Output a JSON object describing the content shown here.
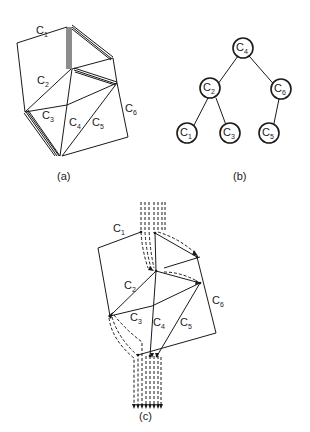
{
  "figure": {
    "panels": [
      {
        "id": "a",
        "caption": "(a)",
        "description": "Triangulated polygon partitioned into chains",
        "chain_labels": [
          {
            "name": "C",
            "sub": "1"
          },
          {
            "name": "C",
            "sub": "2"
          },
          {
            "name": "C",
            "sub": "3"
          },
          {
            "name": "C",
            "sub": "4"
          },
          {
            "name": "C",
            "sub": "5"
          },
          {
            "name": "C",
            "sub": "6"
          }
        ]
      },
      {
        "id": "b",
        "caption": "(b)",
        "description": "Binary tree of chains",
        "nodes": [
          {
            "name": "C",
            "sub": "4"
          },
          {
            "name": "C",
            "sub": "2"
          },
          {
            "name": "C",
            "sub": "6"
          },
          {
            "name": "C",
            "sub": "1"
          },
          {
            "name": "C",
            "sub": "3"
          },
          {
            "name": "C",
            "sub": "5"
          }
        ],
        "edges": [
          [
            "C4",
            "C2"
          ],
          [
            "C4",
            "C6"
          ],
          [
            "C2",
            "C1"
          ],
          [
            "C2",
            "C3"
          ],
          [
            "C6",
            "C5"
          ]
        ]
      },
      {
        "id": "c",
        "caption": "(c)",
        "description": "Chains with dashed flow paths and arrows",
        "chain_labels": [
          {
            "name": "C",
            "sub": "1"
          },
          {
            "name": "C",
            "sub": "2"
          },
          {
            "name": "C",
            "sub": "3"
          },
          {
            "name": "C",
            "sub": "4"
          },
          {
            "name": "C",
            "sub": "5"
          },
          {
            "name": "C",
            "sub": "6"
          }
        ]
      }
    ]
  }
}
